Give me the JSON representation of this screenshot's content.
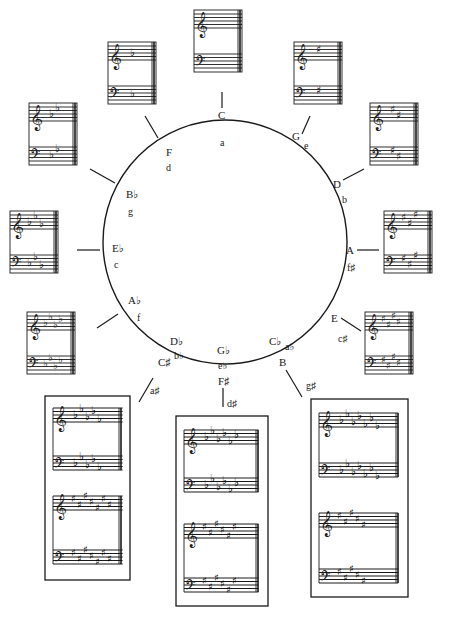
{
  "colors": {
    "ink": "#1a1a1a",
    "paper": "#ffffff"
  },
  "circle": {
    "cx": 225,
    "cy": 242,
    "r": 122
  },
  "keys": [
    {
      "id": "c",
      "major": "C",
      "minor": "a",
      "accidental": "none",
      "count": 0
    },
    {
      "id": "g",
      "major": "G",
      "minor": "e",
      "accidental": "sharp",
      "count": 1
    },
    {
      "id": "d",
      "major": "D",
      "minor": "b",
      "accidental": "sharp",
      "count": 2
    },
    {
      "id": "a",
      "major": "A",
      "minor": "f♯",
      "accidental": "sharp",
      "count": 3
    },
    {
      "id": "e",
      "major": "E",
      "minor": "c♯",
      "accidental": "sharp",
      "count": 4
    },
    {
      "id": "b",
      "major": "B",
      "minor": "g♯",
      "accidental": "sharp",
      "count": 5,
      "enharmonic": {
        "major": "C♭",
        "minor": "a♭",
        "accidental": "flat",
        "count": 7
      }
    },
    {
      "id": "fs",
      "major": "F♯",
      "minor": "d♯",
      "accidental": "sharp",
      "count": 6,
      "enharmonic": {
        "major": "G♭",
        "minor": "e♭",
        "accidental": "flat",
        "count": 6
      }
    },
    {
      "id": "cs",
      "major": "C♯",
      "minor": "a♯",
      "accidental": "sharp",
      "count": 7,
      "enharmonic": {
        "major": "D♭",
        "minor": "b♭",
        "accidental": "flat",
        "count": 5
      }
    },
    {
      "id": "ab",
      "major": "A♭",
      "minor": "f",
      "accidental": "flat",
      "count": 4
    },
    {
      "id": "eb",
      "major": "E♭",
      "minor": "c",
      "accidental": "flat",
      "count": 3
    },
    {
      "id": "bb",
      "major": "B♭",
      "minor": "g",
      "accidental": "flat",
      "count": 2
    },
    {
      "id": "f",
      "major": "F",
      "minor": "d",
      "accidental": "flat",
      "count": 1
    }
  ],
  "labels": {
    "C": "C",
    "a": "a",
    "G": "G",
    "e": "e",
    "D": "D",
    "b": "b",
    "A": "A",
    "fs": "f♯",
    "E": "E",
    "cs_min": "c♯",
    "Cb": "C♭",
    "ab_min": "a♭",
    "B": "B",
    "gs": "g♯",
    "Gb": "G♭",
    "eb_min": "e♭",
    "Fs": "F♯",
    "ds": "d♯",
    "Db": "D♭",
    "bb_min": "b♭",
    "Cs": "C♯",
    "as": "a♯",
    "Ab": "A♭",
    "f_min": "f",
    "Eb": "E♭",
    "c_min": "c",
    "Bb": "B♭",
    "g_min": "g",
    "F": "F",
    "d_min": "d"
  },
  "glyphs": {
    "treble_clef": "𝄞",
    "bass_clef": "𝄢",
    "sharp": "♯",
    "flat": "♭"
  }
}
